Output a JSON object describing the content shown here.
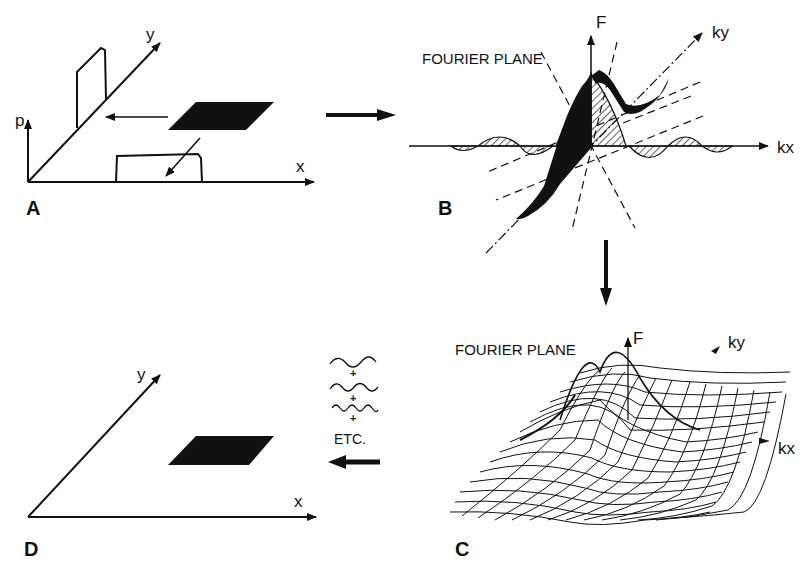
{
  "figure": {
    "panels": {
      "A": {
        "letter": "A",
        "axes": {
          "vertical": "p",
          "diagonal": "y",
          "horizontal": "x"
        }
      },
      "B": {
        "letter": "B",
        "plane_label": "FOURIER PLANE",
        "axes": {
          "vertical": "F",
          "diagonal": "ky",
          "horizontal": "kx"
        }
      },
      "C": {
        "letter": "C",
        "plane_label": "FOURIER PLANE",
        "axes": {
          "vertical": "F",
          "diagonal": "ky",
          "horizontal": "kx"
        }
      },
      "D": {
        "letter": "D",
        "axes": {
          "diagonal": "y",
          "horizontal": "x"
        },
        "sum_legend": {
          "plus": "+",
          "etc": "ETC."
        }
      }
    }
  }
}
